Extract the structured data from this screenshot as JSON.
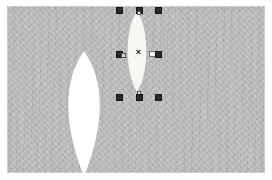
{
  "app": {
    "kind": "vector-graphics-canvas",
    "title": "Canvas"
  },
  "canvas": {
    "background_color": "#b9b9b9",
    "border_color": "#ffffff",
    "texture": "diagonal-hatch",
    "width": 258,
    "height": 167
  },
  "shapes": [
    {
      "id": "lens-large",
      "name": "Large lens shape",
      "fill": "#ffffff",
      "selected": false,
      "x": 61,
      "y": 52,
      "width": 46,
      "height": 126
    },
    {
      "id": "lens-small",
      "name": "Small lens shape",
      "fill": "#f7f6f2",
      "selected": true,
      "x": 124,
      "y": 11,
      "width": 28,
      "height": 82
    }
  ],
  "selection": {
    "active": true,
    "target": "lens-small",
    "handle_color": "#2b2b2b",
    "center_marker": "×",
    "handles": [
      {
        "name": "handle-top-left",
        "x": 116,
        "y": 7
      },
      {
        "name": "handle-top-center",
        "x": 136,
        "y": 7
      },
      {
        "name": "handle-top-right",
        "x": 155,
        "y": 7
      },
      {
        "name": "handle-middle-left",
        "x": 116,
        "y": 51
      },
      {
        "name": "handle-middle-right",
        "x": 155,
        "y": 51
      },
      {
        "name": "handle-bottom-left",
        "x": 116,
        "y": 94
      },
      {
        "name": "handle-bottom-center",
        "x": 136,
        "y": 94
      },
      {
        "name": "handle-bottom-right",
        "x": 155,
        "y": 94
      }
    ],
    "center": {
      "x": 137,
      "y": 52
    }
  },
  "pointer": {
    "name": "mouse-cursor",
    "x": 149,
    "y": 52,
    "near_handle": "handle-middle-right"
  }
}
